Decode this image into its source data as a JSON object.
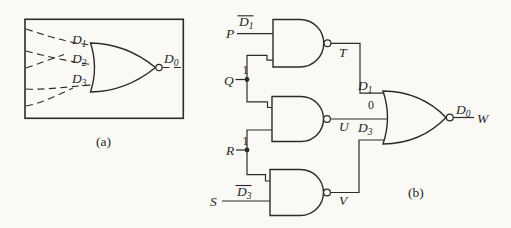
{
  "colors": {
    "ink": "#262626",
    "paper": "#faf9f6"
  },
  "figure_a": {
    "caption": "(a)",
    "gate_type": "NOR (3-input, dashed demultiplexer box)",
    "inputs": [
      {
        "main": "D",
        "sub": "1"
      },
      {
        "main": "D",
        "sub": "2"
      },
      {
        "main": "D",
        "sub": "3"
      }
    ],
    "output": {
      "main": "D",
      "sub": "0"
    }
  },
  "figure_b": {
    "caption": "(b)",
    "inputs": [
      {
        "name": "P",
        "annotation_main": "D",
        "annotation_sub": "1",
        "annotation_overline": true
      },
      {
        "name": "Q",
        "annotation": "1"
      },
      {
        "name": "R",
        "annotation": "1"
      },
      {
        "name": "S",
        "annotation_main": "D",
        "annotation_sub": "3",
        "annotation_overline": true
      }
    ],
    "nand_outputs": [
      "T",
      "U",
      "V"
    ],
    "final_gate": {
      "gate_type": "NOR (3-input)",
      "input_labels": [
        {
          "main": "D",
          "sub": "1"
        },
        {
          "value": "0"
        },
        {
          "main": "D",
          "sub": "3"
        }
      ],
      "output": {
        "main": "D",
        "sub": "0"
      },
      "output_wire_label": "W"
    }
  }
}
